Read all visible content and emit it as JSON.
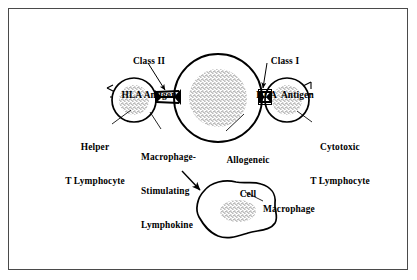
{
  "figure": {
    "domain": "diagram",
    "background_color": "#ffffff",
    "ink_color": "#000000",
    "frame_color": "#4a4a4a"
  },
  "labels": {
    "class_ii": {
      "line1": "Class II",
      "line2": "HLA Antigen"
    },
    "class_i": {
      "line1": "Class I",
      "line2": "HLA  Antigen"
    },
    "helper_t": {
      "line1": "Helper",
      "line2": "T Lymphocyte"
    },
    "cytotoxic_t": {
      "line1": "Cytotoxic",
      "line2": "T Lymphocyte"
    },
    "lymphokine": {
      "line1": "Macrophage-",
      "line2": "Stimulating",
      "line3": "Lymphokine"
    },
    "allogeneic": {
      "line1": "Allogeneic",
      "line2": "Cell"
    },
    "macrophage": {
      "line1": "Macrophage"
    }
  },
  "cells": [
    {
      "name": "helper-t-lymphocyte",
      "shape": "circle",
      "center": [
        134,
        100
      ],
      "radius": 22,
      "nucleus_radius": 15,
      "nucleus_fill": "stipple",
      "receptor_spikes": 3
    },
    {
      "name": "allogeneic-cell",
      "shape": "circle",
      "center": [
        218,
        98
      ],
      "radius": 44,
      "nucleus_radius": 29,
      "nucleus_fill": "stipple",
      "receptor_spikes": 0
    },
    {
      "name": "cytotoxic-t-lymphocyte",
      "shape": "circle",
      "center": [
        287,
        100
      ],
      "radius": 22,
      "nucleus_radius": 15,
      "nucleus_fill": "stipple",
      "receptor_spikes": 2
    },
    {
      "name": "macrophage",
      "shape": "amoeboid-blob",
      "center": [
        242,
        214
      ],
      "nucleus_fill": "stipple"
    }
  ],
  "junctions": [
    {
      "name": "class-ii-hla-junction",
      "position": [
        168,
        97
      ],
      "rungs": 3
    },
    {
      "name": "class-i-hla-junction",
      "position": [
        265,
        97
      ],
      "rungs": 2
    }
  ],
  "arrows": [
    {
      "name": "class-ii-leader-arrow",
      "from": [
        149,
        63
      ],
      "to": [
        166,
        92
      ]
    },
    {
      "name": "class-i-leader-arrow",
      "from": [
        266,
        63
      ],
      "to": [
        263,
        90
      ]
    },
    {
      "name": "lymphokine-to-macrophage-arrow",
      "from": [
        182,
        170
      ],
      "to": [
        201,
        190
      ]
    }
  ],
  "leader_lines": [
    {
      "name": "helper-t-leader",
      "from": [
        112,
        125
      ],
      "to": [
        132,
        110
      ]
    },
    {
      "name": "lymphokine-leader",
      "from": [
        160,
        130
      ],
      "to": [
        150,
        113
      ]
    },
    {
      "name": "allogeneic-leader",
      "from": [
        226,
        130
      ],
      "to": [
        243,
        114
      ]
    },
    {
      "name": "cytotoxic-leader",
      "from": [
        311,
        122
      ],
      "to": [
        297,
        112
      ]
    },
    {
      "name": "macrophage-leader",
      "from": [
        245,
        191
      ],
      "to": [
        262,
        200
      ]
    }
  ]
}
